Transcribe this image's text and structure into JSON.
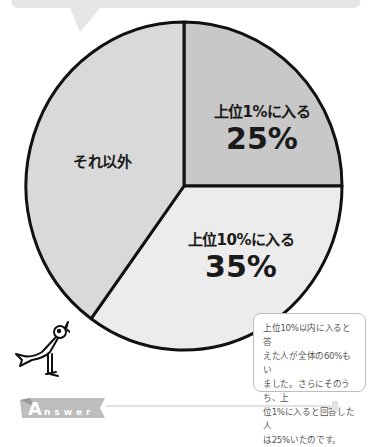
{
  "chart_data": {
    "type": "pie",
    "title": "",
    "start": "top, clockwise",
    "slices": [
      {
        "label": "上位1%に入る",
        "value": 25,
        "display": "25%",
        "color": "#c8c8c8"
      },
      {
        "label": "上位10%に入る",
        "value": 35,
        "display": "35%",
        "color": "#ececec"
      },
      {
        "label": "それ以外",
        "value": 40,
        "display": "",
        "color": "#d9d9d9"
      }
    ]
  },
  "note": {
    "lines": [
      "上位10%以内に入ると答",
      "えた人が全体の60%もい",
      "ました。さらにそのうち、上",
      "位1%に入ると回答した人",
      "は25%いたのです。"
    ]
  },
  "answer_banner": {
    "first_letter": "A",
    "rest": "nswer"
  }
}
